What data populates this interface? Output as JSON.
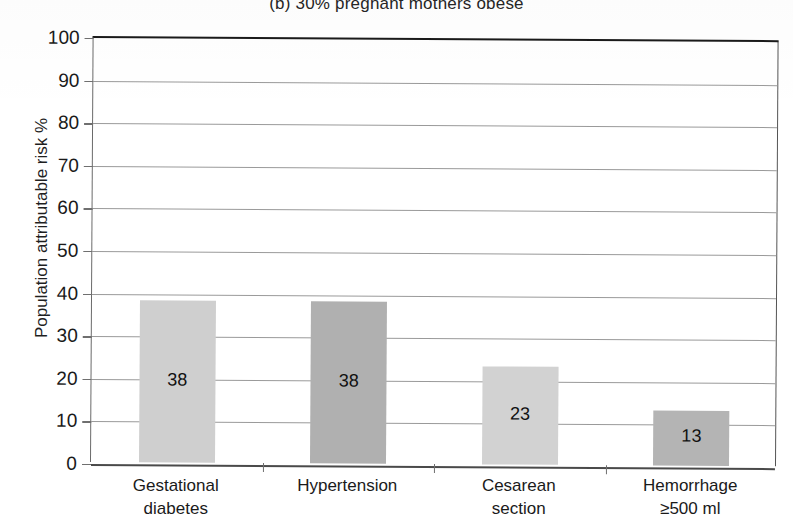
{
  "chart_data": {
    "type": "bar",
    "title": "(b) 30% pregnant mothers obese",
    "xlabel": "",
    "ylabel": "Population attributable risk %",
    "ylim": [
      0,
      100
    ],
    "ytick_interval": 10,
    "grid": "horizontal",
    "legend": "none",
    "categories": [
      "Gestational diabetes",
      "Hypertension",
      "Cesarean section",
      "Hemorrhage ≥500 ml"
    ],
    "category_lines": [
      [
        "Gestational",
        "diabetes"
      ],
      [
        "Hypertension",
        ""
      ],
      [
        "Cesarean",
        "section"
      ],
      [
        "Hemorrhage",
        "≥500 ml"
      ]
    ],
    "values": [
      38,
      38,
      23,
      13
    ],
    "bar_labels": [
      "38",
      "38",
      "23",
      "13"
    ],
    "bar_colors": [
      "#cfcfcf",
      "#b0b0b0",
      "#d2d2d2",
      "#b4b4b4"
    ],
    "ticks": [
      "0",
      "10",
      "20",
      "30",
      "40",
      "50",
      "60",
      "70",
      "80",
      "90",
      "100"
    ]
  },
  "axis": {
    "y_title": "Population attributable risk %"
  }
}
